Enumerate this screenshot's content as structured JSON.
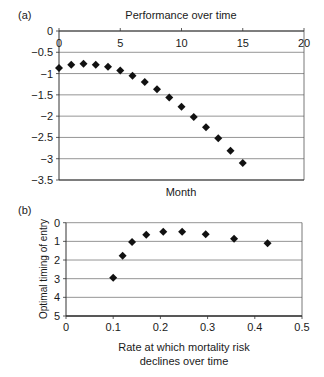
{
  "chart_data": [
    {
      "panel_label": "(a)",
      "type": "scatter",
      "title": "Performance over time",
      "xlabel": "Month",
      "ylabel": "",
      "xlim": [
        0,
        20
      ],
      "ylim": [
        -3.5,
        0
      ],
      "x_ticks": [
        "0",
        "5",
        "10",
        "15",
        "20"
      ],
      "y_ticks": [
        "0",
        "−0.5",
        "−1",
        "−1.5",
        "−2",
        "−2.5",
        "−3",
        "−3.5"
      ],
      "x_tick_position": "top",
      "grid": "horizontal",
      "marker": "diamond",
      "x": [
        0,
        1,
        2,
        3,
        4,
        5,
        6,
        7,
        8,
        9,
        10,
        11,
        12,
        13,
        14,
        15
      ],
      "y": [
        -0.87,
        -0.79,
        -0.77,
        -0.79,
        -0.84,
        -0.93,
        -1.05,
        -1.2,
        -1.37,
        -1.56,
        -1.78,
        -2.02,
        -2.26,
        -2.52,
        -2.81,
        -3.1
      ]
    },
    {
      "panel_label": "(b)",
      "type": "scatter",
      "title": "",
      "xlabel": "Rate at which mortality risk declines over time",
      "xlabel_lines": [
        "Rate at which mortality risk",
        "declines over time"
      ],
      "ylabel": "Optimal timing of entry",
      "xlim": [
        0,
        0.5
      ],
      "ylim": [
        0,
        5
      ],
      "x_ticks": [
        "0",
        "0.1",
        "0.2",
        "0.3",
        "0.4",
        "0.5"
      ],
      "y_ticks": [
        "0",
        "1",
        "2",
        "3",
        "4",
        "5"
      ],
      "grid": "horizontal",
      "marker": "diamond",
      "x": [
        0.1,
        0.12,
        0.14,
        0.17,
        0.206,
        0.246,
        0.296,
        0.356,
        0.427
      ],
      "y": [
        2.05,
        3.23,
        3.97,
        4.36,
        4.52,
        4.52,
        4.38,
        4.14,
        3.9
      ]
    }
  ]
}
